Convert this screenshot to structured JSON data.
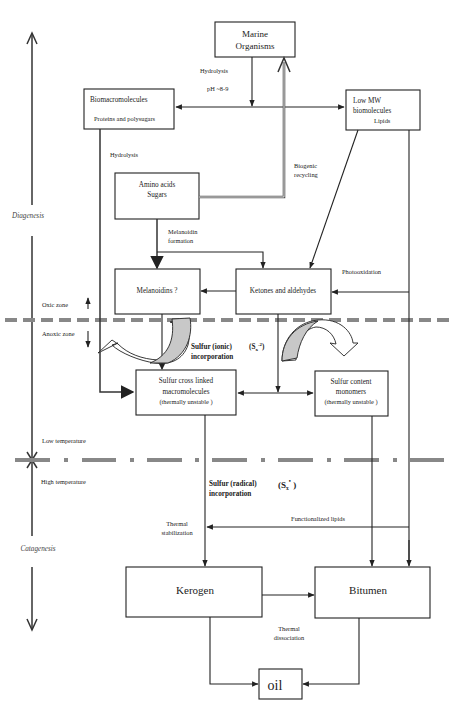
{
  "axis": {
    "diagenesis": "Diagenesis",
    "catagenesis": "Catagenesis"
  },
  "zones": {
    "oxic": "Oxic zone",
    "anoxic": "Anoxic zone",
    "low_temp": "Low temperature",
    "high_temp": "High temperature"
  },
  "boxes": {
    "marine": [
      "Marine",
      "Organisms"
    ],
    "biomacro": [
      "Biomacromolecules",
      "Proteins and polysugars"
    ],
    "lowmw": [
      "Low MW",
      "biomolecules",
      "Lipids"
    ],
    "amino": [
      "Amino acids",
      "Sugars"
    ],
    "melanoidins": "Melanoidins ?",
    "ketones": "Ketones and aldehydes",
    "sulfur_cross": [
      "Sulfur cross linked",
      "macromolecules",
      "(thermally unstable )"
    ],
    "sulfur_content": [
      "Sulfur content",
      "monomers",
      "(thermally unstable )"
    ],
    "kerogen": "Kerogen",
    "bitumen": "Bitumen",
    "oil": "oil"
  },
  "labels": {
    "hydrolysis_top": "Hydrolysis",
    "ph": "pH ~8-9",
    "hydrolysis_left": "Hydrolysis",
    "biogenic": [
      "Biogenic",
      "recycling"
    ],
    "melanoidin_formation": [
      "Melanoidin",
      "formation"
    ],
    "photooxidation": "Photooxidation",
    "sulfur_ionic": [
      "Sulfur (ionic)",
      "incorporation"
    ],
    "sulfur_ionic_formula": "(S",
    "sulfur_ionic_sub": "x",
    "sulfur_ionic_sup": "-2",
    "sulfur_radical": [
      "Sulfur (radical)",
      "incorporation"
    ],
    "sulfur_radical_formula": "(S",
    "sulfur_radical_sub": "x",
    "sulfur_radical_sup": "•",
    "functionalized_lipids": "Functionalized lipids",
    "thermal_stabilization": [
      "Thermal",
      "stabilization"
    ],
    "thermal_dissociation": [
      "Thermal",
      "dissociation"
    ]
  },
  "colors": {
    "line": "#222222",
    "dashed_boundary": "#888888",
    "shaded_arrow": "#c8c8c8"
  }
}
